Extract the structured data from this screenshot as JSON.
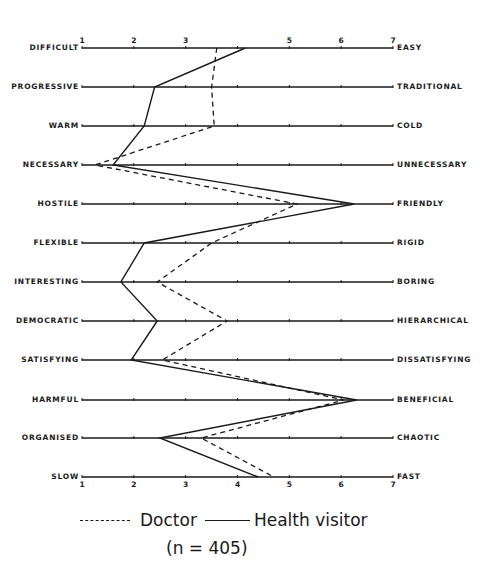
{
  "chart_data": {
    "type": "line",
    "title": "",
    "xlabel": "",
    "ylabel": "",
    "xlim": [
      1,
      7
    ],
    "x_ticks": [
      "1",
      "2",
      "3",
      "4",
      "5",
      "6",
      "7"
    ],
    "grid": false,
    "orientation": "semantic differential profile (horizontal scales)",
    "left_labels": [
      "DIFFICULT",
      "PROGRESSIVE",
      "WARM",
      "NECESSARY",
      "HOSTILE",
      "FLEXIBLE",
      "INTERESTING",
      "DEMOCRATIC",
      "SATISFYING",
      "HARMFUL",
      "ORGANISED",
      "SLOW"
    ],
    "right_labels": [
      "EASY",
      "TRADITIONAL",
      "COLD",
      "UNNECESSARY",
      "FRIENDLY",
      "RIGID",
      "BORING",
      "HIERARCHICAL",
      "DISSATISFYING",
      "BENEFICIAL",
      "CHAOTIC",
      "FAST"
    ],
    "series": [
      {
        "name": "Doctor",
        "style": "dashed",
        "values": [
          3.6,
          3.5,
          3.55,
          1.25,
          5.15,
          3.5,
          2.45,
          3.8,
          2.55,
          6.05,
          3.3,
          4.7
        ]
      },
      {
        "name": "Health visitor",
        "style": "solid",
        "values": [
          4.15,
          2.4,
          2.2,
          1.6,
          6.25,
          2.2,
          1.75,
          2.45,
          1.95,
          6.3,
          2.5,
          4.4
        ]
      }
    ],
    "legend": {
      "position": "bottom",
      "entries": [
        "Doctor",
        "Health visitor"
      ],
      "note": "(n = 405)"
    }
  },
  "legend": {
    "doctor_label": "Doctor",
    "hv_label": "Health visitor",
    "n_label": "(n = 405)"
  }
}
